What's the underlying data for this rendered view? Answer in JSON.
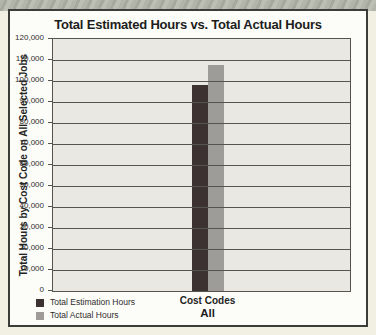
{
  "chart_data": {
    "type": "bar",
    "title": "Total Estimated Hours vs. Total Actual Hours",
    "categories": [
      "All"
    ],
    "series": [
      {
        "name": "Total Estimation Hours",
        "values": [
          98000
        ],
        "color": "#3b3231"
      },
      {
        "name": "Total Actual Hours",
        "values": [
          107500
        ],
        "color": "#9d9c99"
      }
    ],
    "xlabel": "Cost Codes",
    "ylabel": "Total Hours by Cost Code on All Selected Jobs",
    "ylim": [
      0,
      120000
    ],
    "ytick_step": 10000,
    "grid": true,
    "legend_position": "bottom-left",
    "plot_background": "#e9e8e3",
    "gridline_color": "#55544e"
  }
}
